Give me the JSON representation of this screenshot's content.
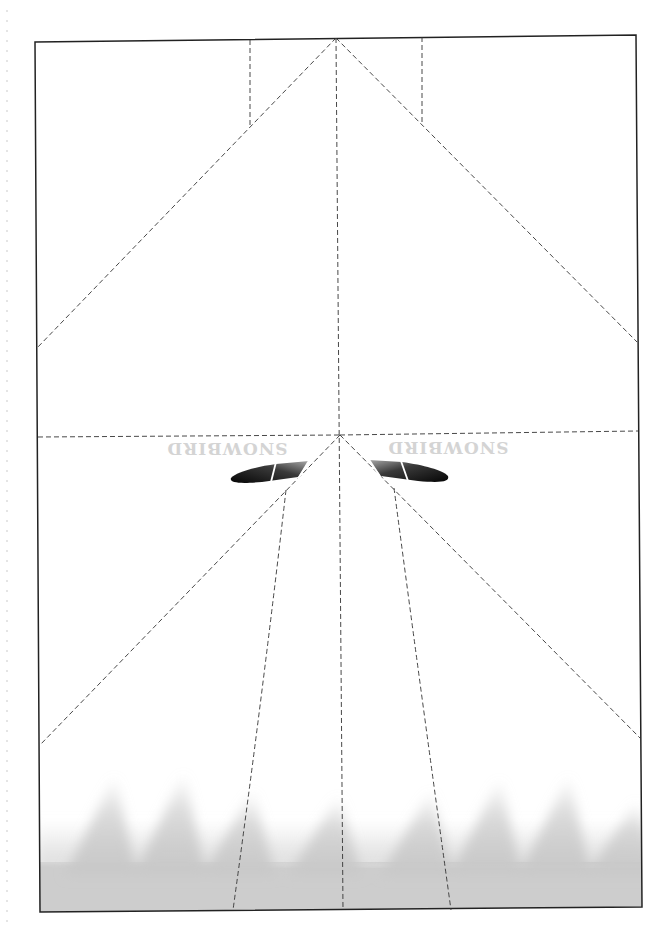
{
  "template": {
    "title": "Paper airplane fold template",
    "brand": {
      "text": "SNOWBIRD",
      "orientation": "upside-down",
      "color": "#d4d4d4"
    },
    "lines": {
      "border_color": "#222222",
      "fold_line_style": "dashed",
      "fold_line_color": "#333333"
    },
    "canopy": {
      "color_dark": "#111111",
      "color_light": "#9a9a9a",
      "panels_per_side": 3
    },
    "exhaust_pattern": {
      "description": "gray flame/spike pattern along bottom edge",
      "color": "#c9c9c9",
      "spike_count": 8
    },
    "margin_marks": {
      "style": "faint dotted line along left edge"
    }
  }
}
